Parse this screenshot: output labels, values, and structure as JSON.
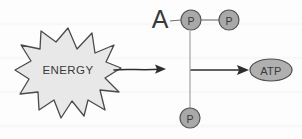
{
  "diagram": {
    "background_color": "#fdfdfd",
    "energy_burst": {
      "label": "ENERGY",
      "fill_color": "#e8e8e8",
      "stroke_color": "#4a4a4a",
      "center_x": 68,
      "center_y": 71
    },
    "reaction_arrow": {
      "name": "energy-to-reaction-arrow",
      "stroke_color": "#2e2e2e",
      "x1": 114,
      "y1": 70,
      "x2": 166,
      "y2": 69
    },
    "adenosine": {
      "label": "A",
      "color": "#1f1f1f",
      "x": 160,
      "y": 19
    },
    "phosphates": [
      {
        "label": "P",
        "name": "phosphate-1",
        "cx": 191,
        "cy": 20,
        "r": 10
      },
      {
        "label": "P",
        "name": "phosphate-2",
        "cx": 229,
        "cy": 20,
        "r": 10
      },
      {
        "label": "P",
        "name": "phosphate-3",
        "cx": 190,
        "cy": 118,
        "r": 10
      }
    ],
    "phosphate_style": {
      "fill_color": "#a9a9a9",
      "stroke_color": "#555555",
      "text_color": "#3c3c3c"
    },
    "bond_line": {
      "name": "adenosine-phosphate-bond",
      "stroke_color": "#7a7a7a"
    },
    "vertical_line": {
      "name": "free-phosphate-connector",
      "stroke_color": "#8a8a8a",
      "x": 190,
      "y_top": 31,
      "y_bottom": 108
    },
    "product_arrow": {
      "name": "arrow-to-atp",
      "stroke_color": "#2e2e2e",
      "x1": 191,
      "y1": 70,
      "x2": 247,
      "y2": 70
    },
    "product": {
      "label": "ATP",
      "name": "atp-molecule",
      "fill_color": "#b0b0b0",
      "stroke_color": "#4f4f4f",
      "text_color": "#2b2b2b",
      "cx": 271,
      "cy": 70,
      "rx": 21,
      "ry": 11
    }
  }
}
